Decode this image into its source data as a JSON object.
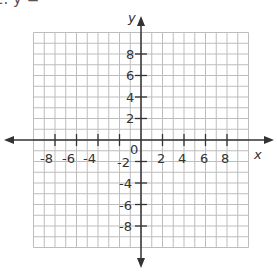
{
  "header": {
    "problem_label": "2.  y ="
  },
  "graph": {
    "x_axis_label": "x",
    "y_axis_label": "y",
    "origin_label": "0",
    "range": {
      "x": [
        -10,
        10
      ],
      "y": [
        -10,
        10
      ]
    },
    "grid_step": 1,
    "x_tick_labels": [
      "-8",
      "-6",
      "-4",
      "-2",
      "2",
      "4",
      "6",
      "8"
    ],
    "y_tick_labels_positive": [
      "8",
      "6",
      "4",
      "2"
    ],
    "y_tick_labels_negative": [
      "-2",
      "-4",
      "-6",
      "-8"
    ],
    "colors": {
      "grid": "#bdbdbd",
      "axis": "#333333",
      "text": "#333333"
    }
  }
}
